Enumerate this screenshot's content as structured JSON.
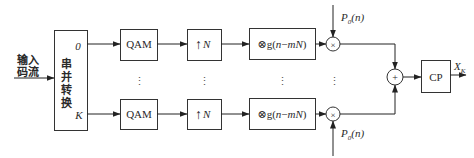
{
  "diagram": {
    "type": "block-diagram",
    "input": {
      "label_line1": "输入",
      "label_line2": "码流"
    },
    "sp_converter": {
      "label_chars": [
        "串",
        "并",
        "转",
        "换"
      ],
      "port_top": "0",
      "port_bottom": "K"
    },
    "branches": [
      {
        "index": "0",
        "qam_label": "QAM",
        "upsample_arrow": "↑",
        "upsample_factor": "N",
        "filter_prefix": "⊗g(",
        "filter_n": "n",
        "filter_minus": "−",
        "filter_mN": "mN",
        "filter_suffix": ")",
        "multiplier_symbol": "×",
        "carrier_P": "P",
        "carrier_sub": "0",
        "carrier_arg": "(n)"
      },
      {
        "index": "K",
        "qam_label": "QAM",
        "upsample_arrow": "↑",
        "upsample_factor": "N",
        "filter_prefix": "⊗g(",
        "filter_n": "n",
        "filter_minus": "−",
        "filter_mN": "mN",
        "filter_suffix": ")",
        "multiplier_symbol": "×",
        "carrier_P": "P",
        "carrier_sub": "0",
        "carrier_arg": "(n)"
      }
    ],
    "ellipsis": "⋮",
    "summer_symbol": "+",
    "cp_label": "CP",
    "output": {
      "X": "X",
      "sub": "K"
    },
    "colors": {
      "line": "#222222",
      "box_stroke": "#333333",
      "text": "#2a2a2a",
      "background": "#ffffff"
    }
  }
}
